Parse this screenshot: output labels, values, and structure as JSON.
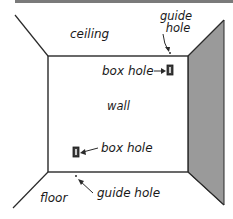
{
  "diagram": {
    "type": "room-perspective",
    "colors": {
      "line": "#2a2a2a",
      "side_wall_fill": "#9a9a9a",
      "top_bar": "#7a7a7a",
      "background": "#ffffff"
    },
    "labels": {
      "ceiling": "ceiling",
      "wall": "wall",
      "floor": "floor",
      "top_guide_hole_line1": "guide",
      "top_guide_hole_line2": "hole",
      "top_box_hole": "box hole",
      "bottom_box_hole": "box hole",
      "bottom_guide_hole": "guide hole"
    },
    "icons": {
      "box_hole": "rectangular-outlet-box",
      "guide_hole": "small-dot",
      "pointer": "arrow"
    }
  }
}
